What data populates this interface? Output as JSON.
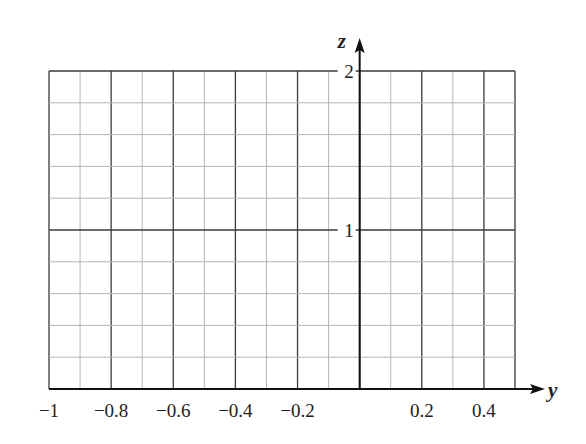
{
  "chart_data": {
    "type": "line",
    "title": "",
    "xlabel": "y",
    "ylabel": "z",
    "xlim": [
      -1,
      0.5
    ],
    "ylim": [
      0,
      2
    ],
    "grid": true,
    "x_ticks": [
      {
        "value": -1,
        "label": "−1"
      },
      {
        "value": -0.8,
        "label": "−0.8"
      },
      {
        "value": -0.6,
        "label": "−0.6"
      },
      {
        "value": -0.4,
        "label": "−0.4"
      },
      {
        "value": -0.2,
        "label": "−0.2"
      },
      {
        "value": 0.2,
        "label": "0.2"
      },
      {
        "value": 0.4,
        "label": "0.4"
      }
    ],
    "y_ticks": [
      {
        "value": 1,
        "label": "1"
      },
      {
        "value": 2,
        "label": "2"
      }
    ],
    "minor_grid_x_step": 0.1,
    "minor_grid_y_step": 0.2,
    "series": []
  },
  "colors": {
    "major_grid": "#3a3a3a",
    "minor_grid": "#b5b5b5",
    "axis": "#111111"
  }
}
